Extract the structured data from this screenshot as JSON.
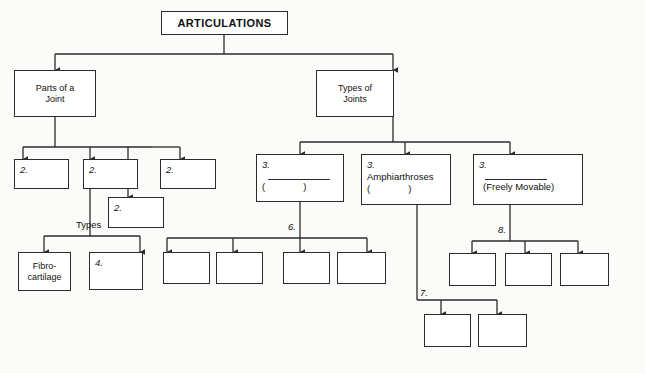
{
  "diagram": {
    "title": "ARTICULATIONS",
    "background": "#fbfbfa",
    "line_color": "#2b2b2b",
    "box_fill": "#ffffff"
  },
  "root": {
    "label": "ARTICULATIONS"
  },
  "branches": {
    "left": {
      "label": "Parts of a Joint",
      "line1": "Parts of a",
      "line2": "Joint"
    },
    "right": {
      "label": "Types of Joints",
      "line1": "Types of",
      "line2": "Joints"
    }
  },
  "parts_children": [
    {
      "num": "2."
    },
    {
      "num": "2."
    },
    {
      "num": "2."
    },
    {
      "num": "2."
    }
  ],
  "types_label": "Types",
  "types_children": [
    {
      "line1": "Fibro-",
      "line2": "cartilage"
    },
    {
      "num": "4."
    }
  ],
  "joint_types": [
    {
      "num": "3.",
      "name": "",
      "has_blank": true,
      "paren_open": "(",
      "paren_close": ")"
    },
    {
      "num": "3.",
      "name": "Amphiarthroses",
      "has_blank": false,
      "paren_open": "(",
      "paren_close": ")"
    },
    {
      "num": "3.",
      "name": "",
      "has_blank": true,
      "subtitle": "(Freely Movable)"
    }
  ],
  "edge_labels": {
    "six": "6.",
    "seven": "7.",
    "eight": "8."
  },
  "blank_groups": {
    "group_six_count": 4,
    "group_eight_count": 3,
    "group_seven_count": 2
  }
}
